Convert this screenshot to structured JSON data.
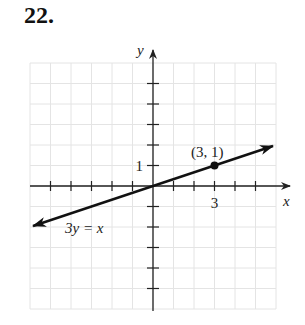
{
  "problem": {
    "number": "22."
  },
  "chart_data": {
    "type": "line",
    "title": "",
    "xlabel": "x",
    "ylabel": "y",
    "xlim": [
      -6,
      6
    ],
    "ylim": [
      -6,
      6
    ],
    "grid": true,
    "x_tick_labels": [
      {
        "value": 3,
        "label": "3"
      }
    ],
    "y_tick_labels": [
      {
        "value": 1,
        "label": "1"
      }
    ],
    "series": [
      {
        "name": "3y = x",
        "equation": "3y = x",
        "slope": 0.3333,
        "intercept": 0,
        "x": [
          -6,
          6
        ],
        "y": [
          -2,
          2
        ],
        "arrows": "both"
      }
    ],
    "points": [
      {
        "x": 3,
        "y": 1,
        "label": "(3, 1)"
      }
    ],
    "annotations": [
      {
        "text": "3y = x",
        "x": -4,
        "y": -2.3
      },
      {
        "text": "(3, 1)",
        "x": 3,
        "y": 1.6
      }
    ]
  },
  "colors": {
    "grid": "#e4e4e4",
    "axis": "#222222",
    "line": "#111111"
  }
}
